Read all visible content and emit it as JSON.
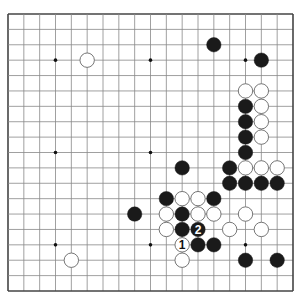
{
  "board": {
    "size": 19,
    "left": 8,
    "top": 14,
    "right": 293,
    "bottom": 291,
    "line_color": "#888888",
    "border_color": "#444444",
    "background": "#ffffff",
    "hoshi": [
      [
        4,
        4
      ],
      [
        10,
        4
      ],
      [
        16,
        4
      ],
      [
        4,
        10
      ],
      [
        10,
        10
      ],
      [
        16,
        10
      ],
      [
        4,
        16
      ],
      [
        10,
        16
      ],
      [
        16,
        16
      ]
    ],
    "stone_radius": 7.2
  },
  "stones": [
    {
      "color": "black",
      "col": 14,
      "row": 3
    },
    {
      "color": "white",
      "col": 6,
      "row": 4
    },
    {
      "color": "black",
      "col": 17,
      "row": 4
    },
    {
      "color": "white",
      "col": 16,
      "row": 6
    },
    {
      "color": "white",
      "col": 17,
      "row": 6
    },
    {
      "color": "black",
      "col": 16,
      "row": 7
    },
    {
      "color": "white",
      "col": 17,
      "row": 7
    },
    {
      "color": "black",
      "col": 16,
      "row": 8
    },
    {
      "color": "white",
      "col": 17,
      "row": 8
    },
    {
      "color": "black",
      "col": 16,
      "row": 9
    },
    {
      "color": "white",
      "col": 17,
      "row": 9
    },
    {
      "color": "black",
      "col": 16,
      "row": 10
    },
    {
      "color": "black",
      "col": 12,
      "row": 11
    },
    {
      "color": "black",
      "col": 15,
      "row": 11
    },
    {
      "color": "white",
      "col": 16,
      "row": 11
    },
    {
      "color": "white",
      "col": 17,
      "row": 11
    },
    {
      "color": "white",
      "col": 18,
      "row": 11
    },
    {
      "color": "black",
      "col": 15,
      "row": 12
    },
    {
      "color": "black",
      "col": 16,
      "row": 12
    },
    {
      "color": "black",
      "col": 17,
      "row": 12
    },
    {
      "color": "black",
      "col": 18,
      "row": 12
    },
    {
      "color": "black",
      "col": 11,
      "row": 13
    },
    {
      "color": "white",
      "col": 12,
      "row": 13
    },
    {
      "color": "white",
      "col": 13,
      "row": 13
    },
    {
      "color": "black",
      "col": 14,
      "row": 13
    },
    {
      "color": "black",
      "col": 9,
      "row": 14
    },
    {
      "color": "white",
      "col": 11,
      "row": 14
    },
    {
      "color": "black",
      "col": 12,
      "row": 14
    },
    {
      "color": "white",
      "col": 13,
      "row": 14
    },
    {
      "color": "white",
      "col": 14,
      "row": 14
    },
    {
      "color": "white",
      "col": 16,
      "row": 14
    },
    {
      "color": "white",
      "col": 11,
      "row": 15
    },
    {
      "color": "black",
      "col": 12,
      "row": 15
    },
    {
      "color": "black",
      "col": 13,
      "row": 15,
      "label": "2"
    },
    {
      "color": "white",
      "col": 15,
      "row": 15
    },
    {
      "color": "white",
      "col": 17,
      "row": 15
    },
    {
      "color": "white",
      "col": 12,
      "row": 16,
      "label": "1"
    },
    {
      "color": "black",
      "col": 13,
      "row": 16
    },
    {
      "color": "black",
      "col": 14,
      "row": 16
    },
    {
      "color": "white",
      "col": 5,
      "row": 17
    },
    {
      "color": "white",
      "col": 12,
      "row": 17
    },
    {
      "color": "black",
      "col": 16,
      "row": 17
    },
    {
      "color": "black",
      "col": 18,
      "row": 17
    }
  ],
  "colors": {
    "black_stone": "#1a1a1a",
    "white_stone": "#ffffff",
    "white_stroke": "#666666",
    "label_on_black": "#ffffff",
    "label_on_white": "#111111"
  }
}
